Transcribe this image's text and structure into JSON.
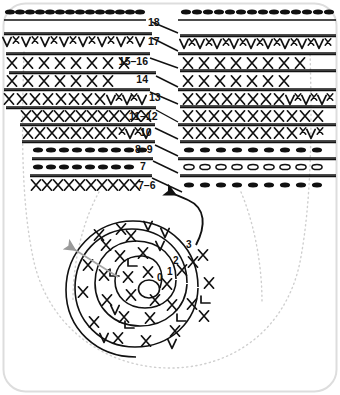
{
  "figure": {
    "background_color": "#ffffff",
    "ink_color": "#111111",
    "frame_color": "#d7d7d7",
    "guide_color": "#c9c9c9",
    "arrow_color": "#9a9a9a"
  },
  "rows": [
    {
      "label": "18",
      "stitch": "double-crochet-oval",
      "left_count": 14,
      "right_count": 14
    },
    {
      "label": "17",
      "stitch": "cross-and-v",
      "left_count": 13,
      "right_count": 13
    },
    {
      "label": "15–16",
      "stitch": "cross",
      "left_count": 8,
      "right_count": 8
    },
    {
      "label": "14",
      "stitch": "cross",
      "left_count": 7,
      "right_count": 7
    },
    {
      "label": "13",
      "stitch": "cross-and-v",
      "left_count": 13,
      "right_count": 13
    },
    {
      "label": "11–12",
      "stitch": "cross",
      "left_count": 12,
      "right_count": 11
    },
    {
      "label": "10",
      "stitch": "cross-and-v",
      "left_count": 11,
      "right_count": 10
    },
    {
      "label": "8–9",
      "stitch": "filled-oval",
      "left_count": 10,
      "right_count": 9
    },
    {
      "label": "7",
      "stitch": "filled-oval",
      "left_count": 10,
      "right_count": 9,
      "right_stitch": "open-oval"
    },
    {
      "label": "7–6",
      "stitch": "cross",
      "left_count": 11,
      "right_count": 9,
      "right_stitch": "filled-oval"
    }
  ],
  "spiral": {
    "round_labels": [
      "0",
      "1",
      "2",
      "3"
    ],
    "rings": 4,
    "stitch": "cross"
  },
  "annotations": {
    "direction_arrow": "work-direction-arrow",
    "join_arrow": "join-arrow",
    "outline": "dotted-bag-outline"
  }
}
